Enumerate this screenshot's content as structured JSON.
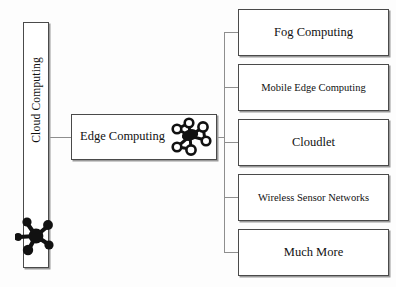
{
  "diagram": {
    "colors": {
      "box_border": "#4a4a4a",
      "box_shadow": "#9a9a9a",
      "connector": "#8e8e8e",
      "text": "#111111",
      "background": "#fdfdfd",
      "icon": "#111111"
    },
    "root": {
      "label": "Cloud Computing",
      "orientation": "vertical",
      "icon": "network-nodes-icon"
    },
    "middle": {
      "label": "Edge Computing",
      "icon": "network-cluster-icon"
    },
    "branches": [
      {
        "label": "Fog Computing",
        "size": "large"
      },
      {
        "label": "Mobile Edge Computing",
        "size": "small"
      },
      {
        "label": "Cloudlet",
        "size": "large"
      },
      {
        "label": "Wireless Sensor Networks",
        "size": "small"
      },
      {
        "label": "Much More",
        "size": "large"
      }
    ]
  }
}
